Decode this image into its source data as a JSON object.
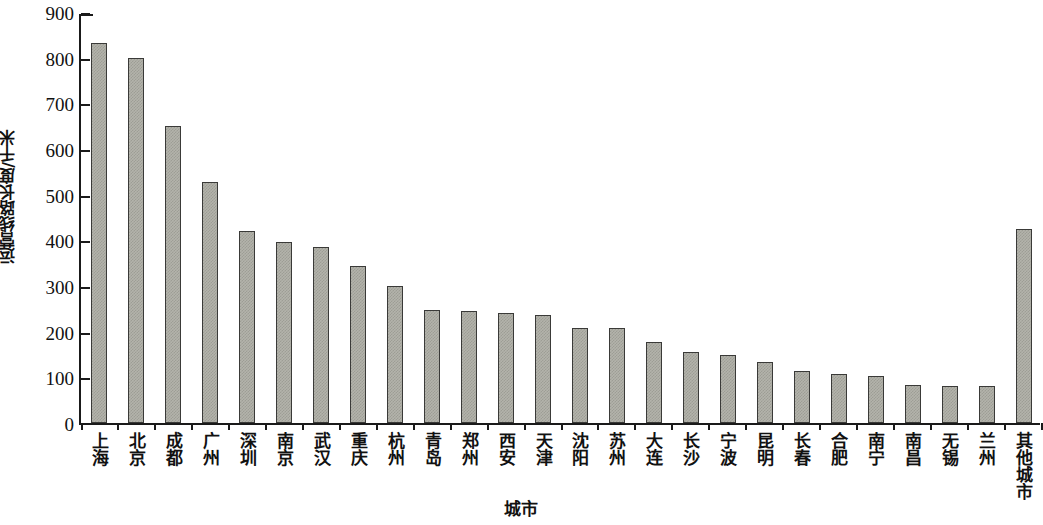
{
  "chart_data": {
    "type": "bar",
    "title": "",
    "xlabel": "城市",
    "ylabel": "运营线路长度/千米",
    "ylim": [
      0,
      900
    ],
    "ytick_values": [
      0,
      100,
      200,
      300,
      400,
      500,
      600,
      700,
      800,
      900
    ],
    "ytick_labels": [
      "0",
      "100",
      "200",
      "300",
      "400",
      "500",
      "600",
      "700",
      "800",
      "900"
    ],
    "grid": false,
    "legend": null,
    "bar_color": "#b3b3ab",
    "bar_edge_color": "#3a3a38",
    "categories": [
      "上海",
      "北京",
      "成都",
      "广州",
      "深圳",
      "南京",
      "武汉",
      "重庆",
      "杭州",
      "青岛",
      "郑州",
      "西安",
      "天津",
      "沈阳",
      "苏州",
      "大连",
      "长沙",
      "宁波",
      "昆明",
      "长春",
      "合肥",
      "南宁",
      "南昌",
      "无锡",
      "兰州",
      "其他城市"
    ],
    "values": [
      832,
      800,
      650,
      527,
      421,
      397,
      385,
      344,
      301,
      248,
      245,
      240,
      237,
      209,
      209,
      178,
      155,
      150,
      134,
      113,
      108,
      102,
      84,
      81,
      80,
      425
    ]
  }
}
